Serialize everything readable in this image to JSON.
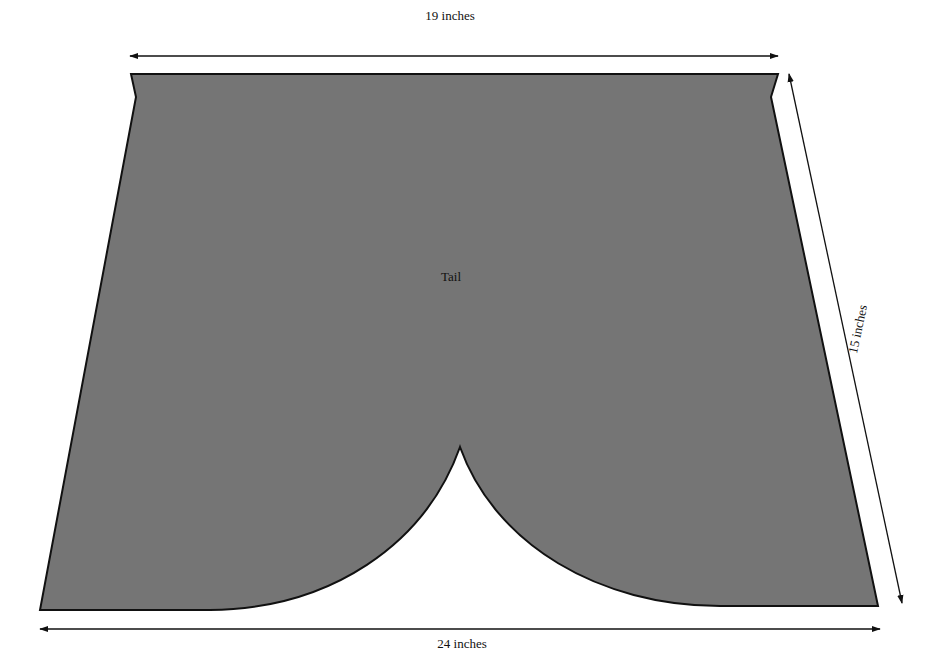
{
  "diagram": {
    "piece_label": "Tail",
    "dimensions": {
      "top": "19 inches",
      "side": "15 inches",
      "bottom": "24 inches"
    },
    "colors": {
      "fill": "#757575",
      "stroke": "#111111",
      "background": "#ffffff"
    }
  }
}
